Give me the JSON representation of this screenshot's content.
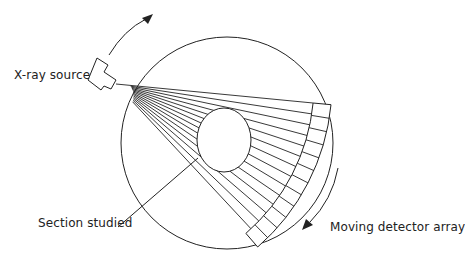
{
  "diagram": {
    "labels": {
      "source": "X-ray source",
      "section": "Section studied",
      "detector": "Moving detector array"
    },
    "colors": {
      "stroke": "#222222",
      "background": "#ffffff"
    },
    "geometry": {
      "gantry_circle": {
        "cx": 227,
        "cy": 143,
        "r": 106
      },
      "section_ellipse": {
        "cx": 224,
        "cy": 140,
        "rx": 27,
        "ry": 32
      },
      "beam_apex": {
        "x": 116,
        "y": 84
      },
      "detector_arc": {
        "inner_r": 198,
        "outer_r": 216,
        "start_deg": 5.5,
        "end_deg": 49,
        "segments": 12
      },
      "beam_count": 14
    }
  }
}
